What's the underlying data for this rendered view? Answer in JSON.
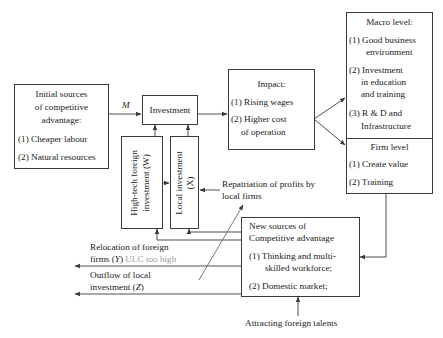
{
  "diagram": {
    "initial_sources": {
      "title_lines": [
        "Initial sources",
        "of competitive",
        "advantage:"
      ],
      "items": [
        "(1) Cheaper labour",
        "(2) Natural resources"
      ]
    },
    "m_label": "M",
    "investment": {
      "label": "Investment"
    },
    "high_tech": {
      "line1": "High-tech foreign",
      "line2": "investment (W)"
    },
    "local_investment": {
      "line1": "Local investment",
      "line2": "(X)"
    },
    "impact": {
      "title": "Impact:",
      "items": [
        "(1) Rising wages",
        "(2) Higher cost",
        "of operation"
      ]
    },
    "macro_level": {
      "title": "Macro level:",
      "items": [
        "(1) Good business",
        "environment",
        "(2) Investment",
        "in education",
        "and training",
        "(3) R & D and",
        "Infrastructure"
      ]
    },
    "firm_level": {
      "title": "Firm level",
      "items": [
        "(1) Create value",
        "(2) Training"
      ]
    },
    "repatriation": {
      "line1": "Repatriation of profits by",
      "line2": "local firms"
    },
    "new_sources": {
      "title_lines": [
        "New sources of",
        "Competitive advantage"
      ],
      "items": [
        "(1) Thinking and multi-",
        "skilled workforce;",
        "(2) Domestic market;"
      ]
    },
    "relocation": {
      "line1": "Relocation of foreign",
      "line2_prefix": "firms (",
      "line2_var": "Y",
      "line2_suffix": ")",
      "note": "ULC too high"
    },
    "outflow": {
      "line1": "Outflow of local",
      "line2_prefix": "investment (",
      "line2_var": "Z",
      "line2_suffix": ")"
    },
    "attracting": {
      "label": "Attracting foreign talents"
    }
  },
  "colors": {
    "line": "#3a3a3a",
    "note_grey": "#9a9a9a",
    "background": "#ffffff"
  }
}
